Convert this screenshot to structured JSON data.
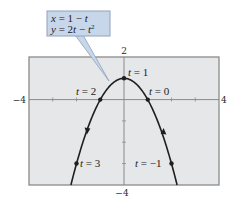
{
  "chart_data": {
    "type": "line",
    "title": "",
    "subtitle": "",
    "xlabel": "",
    "ylabel": "",
    "xlim": [
      -4,
      4
    ],
    "ylim": [
      -4,
      2
    ],
    "grid": false,
    "legend": null,
    "tick_labels": {
      "x_min": "−4",
      "x_max": "4",
      "y_max": "2",
      "y_min": "−4"
    },
    "callout": {
      "line1": {
        "lhs": "x",
        "eq": " = 1 − ",
        "rhs": "t"
      },
      "line2": {
        "lhs": "y",
        "eq": " = 2",
        "mid": "t",
        "minus": " − ",
        "rhs": "t",
        "exp": "2"
      }
    },
    "series": [
      {
        "name": "x = 1 − t, y = 2t − t²",
        "parametric": {
          "x": "1 - t",
          "y": "2t - t^2"
        },
        "t_range": [
          -1.236,
          3.236
        ],
        "orientation": "increasing t from right branch (up) to left branch (down)"
      }
    ],
    "points": [
      {
        "t": 1,
        "x": 0,
        "y": 1,
        "label": "t = 1"
      },
      {
        "t": 0,
        "x": 1,
        "y": 0,
        "label": "t = 0"
      },
      {
        "t": 2,
        "x": -1,
        "y": 0,
        "label": "t = 2"
      },
      {
        "t": 3,
        "x": -2,
        "y": -3,
        "label": "t = 3"
      },
      {
        "t": -1,
        "x": 2,
        "y": -3,
        "label": "t = −1"
      }
    ],
    "point_labels": {
      "t1": {
        "var": "t",
        "rest": " = 1"
      },
      "t0": {
        "var": "t",
        "rest": " = 0"
      },
      "t2": {
        "var": "t",
        "rest": " = 2"
      },
      "t3": {
        "var": "t",
        "rest": " = 3"
      },
      "tm1": {
        "var": "t",
        "rest": " = −1"
      }
    },
    "colors": {
      "plot_bg": "#e5e7e9",
      "frame": "#8a8a8a",
      "curve": "#1f1f1f",
      "callout_fill": "#c8d6ea",
      "callout_border": "#8ea2bd"
    }
  }
}
